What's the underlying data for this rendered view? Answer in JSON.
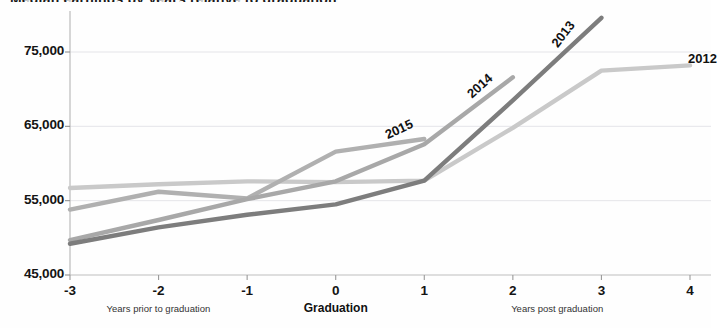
{
  "chart_data": {
    "type": "line",
    "title": "Median earnings by years relative to graduation",
    "xlabel": "",
    "ylabel": "",
    "x": [
      -3,
      -2,
      -1,
      0,
      1,
      2,
      3,
      4
    ],
    "xticklabels": [
      "-3",
      "-2",
      "-1",
      "0",
      "1",
      "2",
      "3",
      "4"
    ],
    "yticks": [
      45000,
      55000,
      65000,
      75000
    ],
    "yticklabels": [
      "45,000",
      "55,000",
      "65,000",
      "75,000"
    ],
    "ylim": [
      45000,
      80500
    ],
    "xlim": [
      -3,
      4
    ],
    "grid": true,
    "legend_position": "inline-end-of-line",
    "axis_group_labels": [
      {
        "text": "Years prior to graduation",
        "center_x": -2,
        "bold": false
      },
      {
        "text": "Graduation",
        "center_x": 0,
        "bold": true
      },
      {
        "text": "Years post graduation",
        "center_x": 2.5,
        "bold": false
      }
    ],
    "series": [
      {
        "name": "2012",
        "color": "#c9c9c9",
        "x": [
          -3,
          -2,
          -1,
          0,
          1,
          2,
          3,
          4
        ],
        "values": [
          56700,
          57200,
          57600,
          57500,
          57700,
          64800,
          72500,
          73200
        ],
        "label_at_x": 4,
        "label_angle": 0
      },
      {
        "name": "2015",
        "color": "#b0b0b0",
        "x": [
          -3,
          -2,
          -1,
          0,
          1
        ],
        "values": [
          53800,
          56200,
          55300,
          61600,
          63300
        ],
        "label_at_x": 0.62,
        "label_angle": -25
      },
      {
        "name": "2014",
        "color": "#a8a8a8",
        "x": [
          -3,
          -2,
          -1,
          0,
          1,
          2
        ],
        "values": [
          49700,
          52400,
          55200,
          57600,
          62600,
          71600
        ],
        "label_at_x": 1.58,
        "label_angle": -42
      },
      {
        "name": "2013",
        "color": "#7d7d7d",
        "x": [
          -3,
          -2,
          -1,
          0,
          1,
          2,
          3
        ],
        "values": [
          49200,
          51400,
          53100,
          54500,
          57700,
          68500,
          79600
        ],
        "label_at_x": 2.55,
        "label_angle": -52
      }
    ]
  },
  "axis": {
    "y_axis_name": "y-axis",
    "x_axis_name": "x-axis"
  }
}
